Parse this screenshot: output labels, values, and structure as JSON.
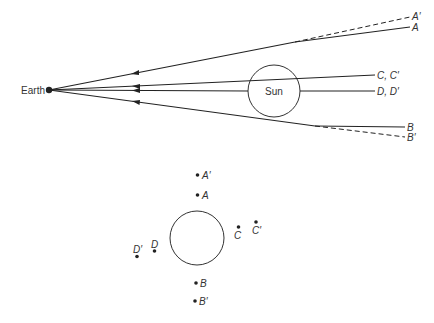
{
  "diagram": {
    "type": "gravitational-light-deflection",
    "top_panel": {
      "earth_label": "Earth",
      "sun_label": "Sun",
      "ray_labels": {
        "a_prime": "A′",
        "a": "A",
        "cc": "C, C′",
        "dd": "D, D′",
        "b": "B",
        "b_prime": "B′"
      },
      "legend": {
        "solid": "apparent path of starlight",
        "dashed": "true direction of star"
      }
    },
    "bottom_panel": {
      "star_labels": {
        "a_prime": "A′",
        "a": "A",
        "c": "C",
        "c_prime": "C′",
        "d": "D",
        "d_prime": "D′",
        "b": "B",
        "b_prime": "B′"
      }
    },
    "colors": {
      "line": "#222222",
      "text": "#333333",
      "background": "#ffffff"
    }
  }
}
